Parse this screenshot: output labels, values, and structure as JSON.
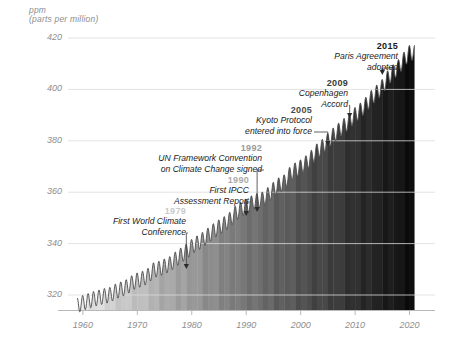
{
  "chart_data": {
    "type": "area",
    "title": "",
    "xlabel": "",
    "ylabel": "ppm",
    "ylabel_sub": "(parts per million)",
    "xlim": [
      1958,
      2021
    ],
    "ylim": [
      314,
      422
    ],
    "yticks": [
      320,
      340,
      360,
      380,
      400,
      420
    ],
    "xticks": [
      1960,
      1970,
      1980,
      1990,
      2000,
      2010,
      2020
    ],
    "grid": true,
    "legend": "none",
    "series_name": "Atmospheric CO2 concentration (Mauna Loa / Keeling Curve)",
    "fill_style": "warming-stripes, one vertical band per year, light grey 1960 to near-black 2020",
    "x": [
      1959,
      1960,
      1961,
      1962,
      1963,
      1964,
      1965,
      1966,
      1967,
      1968,
      1969,
      1970,
      1971,
      1972,
      1973,
      1974,
      1975,
      1976,
      1977,
      1978,
      1979,
      1980,
      1981,
      1982,
      1983,
      1984,
      1985,
      1986,
      1987,
      1988,
      1989,
      1990,
      1991,
      1992,
      1993,
      1994,
      1995,
      1996,
      1997,
      1998,
      1999,
      2000,
      2001,
      2002,
      2003,
      2004,
      2005,
      2006,
      2007,
      2008,
      2009,
      2010,
      2011,
      2012,
      2013,
      2014,
      2015,
      2016,
      2017,
      2018,
      2019,
      2020
    ],
    "values": [
      315.98,
      316.91,
      317.64,
      318.45,
      318.99,
      319.62,
      320.04,
      321.37,
      322.18,
      323.05,
      324.62,
      325.68,
      326.32,
      327.46,
      329.68,
      330.19,
      331.12,
      332.03,
      333.84,
      335.41,
      336.84,
      338.76,
      340.12,
      341.48,
      343.15,
      344.87,
      346.35,
      347.61,
      349.31,
      351.69,
      353.2,
      354.45,
      355.7,
      356.54,
      357.21,
      358.96,
      360.97,
      362.74,
      363.88,
      366.84,
      368.54,
      369.71,
      371.32,
      373.45,
      375.98,
      377.7,
      379.98,
      382.09,
      384.02,
      385.83,
      387.64,
      390.1,
      391.85,
      394.06,
      396.74,
      398.81,
      400.99,
      404.41,
      406.76,
      408.72,
      411.65,
      414.24
    ],
    "annotations": [
      {
        "year": 1979,
        "label": "1979",
        "lines": [
          "First World Climate",
          "Conference"
        ],
        "year_color": "#c9c9c9"
      },
      {
        "year": 1990,
        "label": "1990",
        "lines": [
          "First IPCC",
          "Assessment Report"
        ],
        "year_color": "#aaaaaa"
      },
      {
        "year": 1992,
        "label": "1992",
        "lines": [
          "UN Framework Convention",
          "on Climate Change signed"
        ],
        "year_color": "#9b9b9b"
      },
      {
        "year": 2005,
        "label": "2005",
        "lines": [
          "Kyoto Protocol",
          "entered into force"
        ],
        "year_color": "#4a4a4a"
      },
      {
        "year": 2009,
        "label": "2009",
        "lines": [
          "Copenhagen",
          "Accord"
        ],
        "year_color": "#3a3a3a"
      },
      {
        "year": 2015,
        "label": "2015",
        "lines": [
          "Paris Agreement",
          "adopted"
        ],
        "year_color": "#1a1a1a"
      }
    ]
  },
  "axis": {
    "ppm": "ppm",
    "ppm_sub": "(parts per million)"
  },
  "colors": {
    "grid": "#dcdcdc",
    "axis": "#b0b0b0",
    "tick_text": "#8e8e8e",
    "curve": "#4d4d4d",
    "stripe_first": "#ededed",
    "stripe_last": "#090909"
  }
}
